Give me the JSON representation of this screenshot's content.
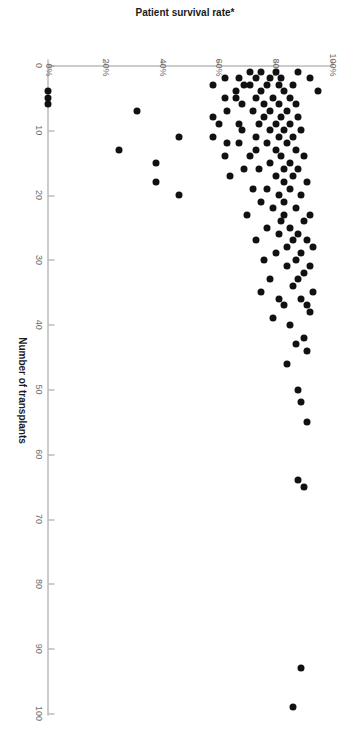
{
  "chart_data": {
    "type": "scatter",
    "title": "",
    "xlabel": "Number of transplants",
    "ylabel": "Patient survival rate*",
    "xlim": [
      0,
      100
    ],
    "ylim": [
      0,
      100
    ],
    "x_ticks": [
      0,
      10,
      20,
      30,
      40,
      50,
      60,
      70,
      80,
      90,
      100
    ],
    "x_tick_labels": [
      "0",
      "10",
      "20",
      "30",
      "40",
      "50",
      "60",
      "70",
      "80",
      "90",
      "100"
    ],
    "y_ticks": [
      0,
      20,
      40,
      60,
      80,
      100
    ],
    "y_tick_labels": [
      "0%",
      "20%",
      "40%",
      "60%",
      "80%",
      "100%"
    ],
    "grid": false,
    "legend": null,
    "marker": {
      "shape": "circle",
      "color": "#111111",
      "size_px": 7
    },
    "axis_color": "#9a9a9a",
    "rotation_deg": 90,
    "footnote_marker": "*",
    "points": [
      {
        "x": 4,
        "y": 0
      },
      {
        "x": 5,
        "y": 0
      },
      {
        "x": 6,
        "y": 0
      },
      {
        "x": 13,
        "y": 25
      },
      {
        "x": 7,
        "y": 31
      },
      {
        "x": 18,
        "y": 38
      },
      {
        "x": 15,
        "y": 38
      },
      {
        "x": 11,
        "y": 46
      },
      {
        "x": 20,
        "y": 46
      },
      {
        "x": 3,
        "y": 58
      },
      {
        "x": 8,
        "y": 58
      },
      {
        "x": 5,
        "y": 62
      },
      {
        "x": 2,
        "y": 62
      },
      {
        "x": 12,
        "y": 63
      },
      {
        "x": 4,
        "y": 66
      },
      {
        "x": 2,
        "y": 67
      },
      {
        "x": 9,
        "y": 67
      },
      {
        "x": 6,
        "y": 68
      },
      {
        "x": 10,
        "y": 68
      },
      {
        "x": 1,
        "y": 71
      },
      {
        "x": 3,
        "y": 71
      },
      {
        "x": 14,
        "y": 71
      },
      {
        "x": 7,
        "y": 72
      },
      {
        "x": 2,
        "y": 73
      },
      {
        "x": 5,
        "y": 73
      },
      {
        "x": 11,
        "y": 73
      },
      {
        "x": 13,
        "y": 73
      },
      {
        "x": 9,
        "y": 74
      },
      {
        "x": 16,
        "y": 74
      },
      {
        "x": 1,
        "y": 75
      },
      {
        "x": 4,
        "y": 75
      },
      {
        "x": 6,
        "y": 76
      },
      {
        "x": 8,
        "y": 76
      },
      {
        "x": 3,
        "y": 77
      },
      {
        "x": 12,
        "y": 77
      },
      {
        "x": 19,
        "y": 77
      },
      {
        "x": 2,
        "y": 78
      },
      {
        "x": 7,
        "y": 78
      },
      {
        "x": 10,
        "y": 78
      },
      {
        "x": 15,
        "y": 78
      },
      {
        "x": 5,
        "y": 79
      },
      {
        "x": 22,
        "y": 79
      },
      {
        "x": 1,
        "y": 80
      },
      {
        "x": 9,
        "y": 80
      },
      {
        "x": 13,
        "y": 80
      },
      {
        "x": 17,
        "y": 80
      },
      {
        "x": 3,
        "y": 81
      },
      {
        "x": 6,
        "y": 81
      },
      {
        "x": 11,
        "y": 81
      },
      {
        "x": 20,
        "y": 81
      },
      {
        "x": 26,
        "y": 81
      },
      {
        "x": 2,
        "y": 82
      },
      {
        "x": 8,
        "y": 82
      },
      {
        "x": 14,
        "y": 82
      },
      {
        "x": 24,
        "y": 82
      },
      {
        "x": 4,
        "y": 83
      },
      {
        "x": 10,
        "y": 83
      },
      {
        "x": 16,
        "y": 83
      },
      {
        "x": 18,
        "y": 83
      },
      {
        "x": 21,
        "y": 83
      },
      {
        "x": 23,
        "y": 83
      },
      {
        "x": 7,
        "y": 84
      },
      {
        "x": 12,
        "y": 84
      },
      {
        "x": 28,
        "y": 84
      },
      {
        "x": 5,
        "y": 85
      },
      {
        "x": 9,
        "y": 85
      },
      {
        "x": 15,
        "y": 85
      },
      {
        "x": 19,
        "y": 85
      },
      {
        "x": 25,
        "y": 85
      },
      {
        "x": 3,
        "y": 86
      },
      {
        "x": 11,
        "y": 86
      },
      {
        "x": 17,
        "y": 86
      },
      {
        "x": 27,
        "y": 86
      },
      {
        "x": 6,
        "y": 87
      },
      {
        "x": 13,
        "y": 87
      },
      {
        "x": 22,
        "y": 87
      },
      {
        "x": 30,
        "y": 87
      },
      {
        "x": 8,
        "y": 88
      },
      {
        "x": 16,
        "y": 88
      },
      {
        "x": 26,
        "y": 88
      },
      {
        "x": 33,
        "y": 88
      },
      {
        "x": 10,
        "y": 89
      },
      {
        "x": 20,
        "y": 89
      },
      {
        "x": 29,
        "y": 89
      },
      {
        "x": 36,
        "y": 89
      },
      {
        "x": 14,
        "y": 90
      },
      {
        "x": 24,
        "y": 90
      },
      {
        "x": 32,
        "y": 90
      },
      {
        "x": 42,
        "y": 90
      },
      {
        "x": 18,
        "y": 91
      },
      {
        "x": 27,
        "y": 91
      },
      {
        "x": 37,
        "y": 91
      },
      {
        "x": 44,
        "y": 91
      },
      {
        "x": 23,
        "y": 92
      },
      {
        "x": 31,
        "y": 92
      },
      {
        "x": 38,
        "y": 92
      },
      {
        "x": 28,
        "y": 93
      },
      {
        "x": 35,
        "y": 93
      },
      {
        "x": 50,
        "y": 88
      },
      {
        "x": 52,
        "y": 89
      },
      {
        "x": 55,
        "y": 91
      },
      {
        "x": 64,
        "y": 88
      },
      {
        "x": 65,
        "y": 90
      },
      {
        "x": 93,
        "y": 89
      },
      {
        "x": 99,
        "y": 86
      },
      {
        "x": 40,
        "y": 85
      },
      {
        "x": 37,
        "y": 83
      },
      {
        "x": 34,
        "y": 86
      },
      {
        "x": 36,
        "y": 81
      },
      {
        "x": 31,
        "y": 84
      },
      {
        "x": 43,
        "y": 87
      },
      {
        "x": 29,
        "y": 80
      },
      {
        "x": 25,
        "y": 77
      },
      {
        "x": 21,
        "y": 75
      },
      {
        "x": 33,
        "y": 78
      },
      {
        "x": 19,
        "y": 72
      },
      {
        "x": 16,
        "y": 69
      },
      {
        "x": 12,
        "y": 67
      },
      {
        "x": 23,
        "y": 70
      },
      {
        "x": 27,
        "y": 73
      },
      {
        "x": 17,
        "y": 64
      },
      {
        "x": 14,
        "y": 62
      },
      {
        "x": 9,
        "y": 60
      },
      {
        "x": 5,
        "y": 66
      },
      {
        "x": 7,
        "y": 63
      },
      {
        "x": 3,
        "y": 69
      },
      {
        "x": 11,
        "y": 58
      },
      {
        "x": 30,
        "y": 76
      },
      {
        "x": 35,
        "y": 75
      },
      {
        "x": 39,
        "y": 79
      },
      {
        "x": 46,
        "y": 84
      },
      {
        "x": 1,
        "y": 88
      },
      {
        "x": 2,
        "y": 92
      },
      {
        "x": 4,
        "y": 95
      }
    ]
  },
  "axis": {
    "x_title": "Number of transplants",
    "y_title": "Patient survival rate*"
  }
}
